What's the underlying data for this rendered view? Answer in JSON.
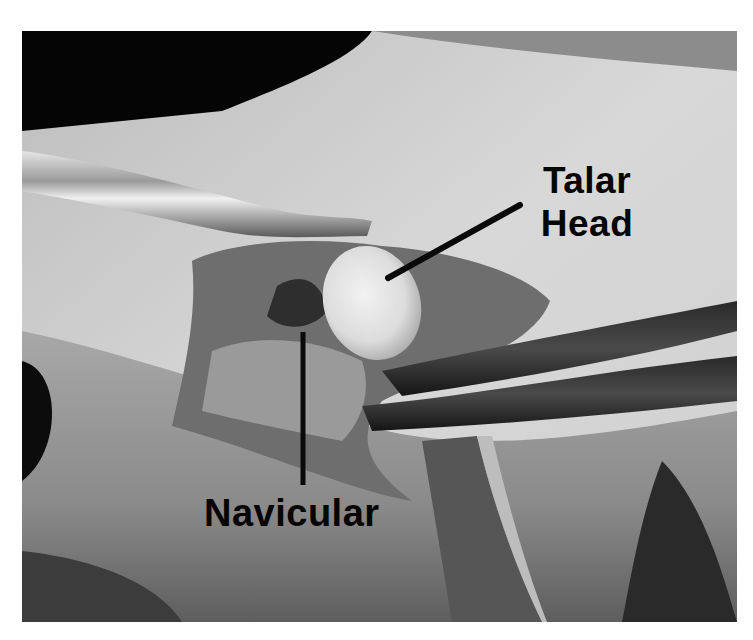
{
  "figure": {
    "labels": [
      {
        "id": "talar-head",
        "line1": "Talar",
        "line2": "Head"
      },
      {
        "id": "navicular",
        "text": "Navicular"
      }
    ],
    "colors": {
      "label_text": "#050505",
      "leader_line": "#0a0a0a",
      "background": "#ffffff"
    }
  }
}
